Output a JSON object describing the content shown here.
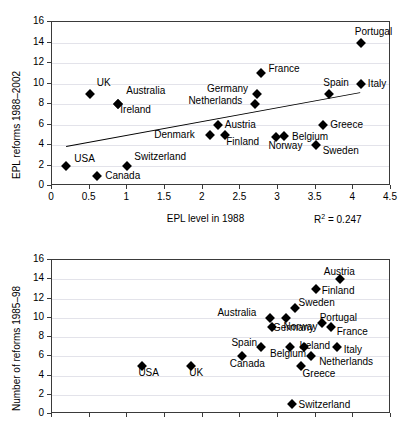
{
  "figure": {
    "background": "#ffffff",
    "marker_color": "#000000",
    "axis_color": "#3a3a3a",
    "grid_color": "#e3e3ea"
  },
  "chart_data": [
    {
      "id": "top",
      "type": "scatter",
      "title": "",
      "xlabel": "EPL level in 1988",
      "ylabel": "EPL reforms 1988–2002",
      "xlim": [
        0,
        4.5
      ],
      "ylim": [
        0,
        16
      ],
      "xticks": [
        0,
        0.5,
        1,
        1.5,
        2,
        2.5,
        3,
        3.5,
        4,
        4.5
      ],
      "xtick_labels": [
        "0",
        "0.5",
        "1",
        "1.5",
        "2",
        "2.5",
        "3",
        "3.5",
        "4",
        "4.5"
      ],
      "yticks": [
        0,
        2,
        4,
        6,
        8,
        10,
        12,
        14,
        16
      ],
      "ytick_labels": [
        "0",
        "2",
        "4",
        "6",
        "8",
        "10",
        "12",
        "14",
        "16"
      ],
      "grid": true,
      "legend": "none",
      "annotation": "R² = 0.247",
      "annotation_value": 0.247,
      "trendline": {
        "x0": 0.18,
        "y0": 3.9,
        "x1": 4.08,
        "y1": 9.15,
        "visible": true
      },
      "points": [
        {
          "label": "USA",
          "x": 0.19,
          "y": 2,
          "lx": 8,
          "ly": -12
        },
        {
          "label": "Canada",
          "x": 0.6,
          "y": 1,
          "lx": 8,
          "ly": -5
        },
        {
          "label": "UK",
          "x": 0.5,
          "y": 9,
          "lx": 7,
          "ly": -16
        },
        {
          "label": "Australia",
          "x": 0.88,
          "y": 8,
          "lx": 8,
          "ly": -18
        },
        {
          "label": "Ireland",
          "x": 0.88,
          "y": 8,
          "lx": 2,
          "ly": 1
        },
        {
          "label": "Switzerland",
          "x": 1.0,
          "y": 2,
          "lx": 7,
          "ly": -14
        },
        {
          "label": "Denmark",
          "x": 2.1,
          "y": 5,
          "lx": -56,
          "ly": -5
        },
        {
          "label": "Austria",
          "x": 2.2,
          "y": 6,
          "lx": 7,
          "ly": -5
        },
        {
          "label": "Finland",
          "x": 2.3,
          "y": 5,
          "lx": 1,
          "ly": 2
        },
        {
          "label": "Netherlands",
          "x": 2.7,
          "y": 8,
          "lx": -67,
          "ly": -8
        },
        {
          "label": "Germany",
          "x": 2.72,
          "y": 9,
          "lx": -50,
          "ly": -10
        },
        {
          "label": "France",
          "x": 2.78,
          "y": 11,
          "lx": 7,
          "ly": -9
        },
        {
          "label": "Norway",
          "x": 2.98,
          "y": 4.8,
          "lx": -8,
          "ly": 4
        },
        {
          "label": "Belgium",
          "x": 3.08,
          "y": 4.9,
          "lx": 8,
          "ly": -4
        },
        {
          "label": "Spain",
          "x": 3.68,
          "y": 9,
          "lx": -6,
          "ly": -16
        },
        {
          "label": "Greece",
          "x": 3.6,
          "y": 6,
          "lx": 7,
          "ly": -5
        },
        {
          "label": "Sweden",
          "x": 3.5,
          "y": 4,
          "lx": 7,
          "ly": 1
        },
        {
          "label": "Portugal",
          "x": 4.1,
          "y": 14,
          "lx": -6,
          "ly": -16
        },
        {
          "label": "Italy",
          "x": 4.1,
          "y": 10,
          "lx": 7,
          "ly": -5
        }
      ]
    },
    {
      "id": "bottom",
      "type": "scatter",
      "title": "",
      "xlabel": "",
      "ylabel": "Number of reforms 1985–98",
      "xlim": [
        0,
        4.5
      ],
      "ylim": [
        0,
        16
      ],
      "xticks": [
        0,
        0.5,
        1,
        1.5,
        2,
        2.5,
        3,
        3.5,
        4,
        4.5
      ],
      "xtick_labels": [
        "",
        "",
        "",
        "",
        "",
        "",
        "",
        "",
        "",
        ""
      ],
      "yticks": [
        0,
        2,
        4,
        6,
        8,
        10,
        12,
        14,
        16
      ],
      "ytick_labels": [
        "0",
        "2",
        "4",
        "6",
        "8",
        "10",
        "12",
        "14",
        "16"
      ],
      "grid": true,
      "legend": "none",
      "annotation": "",
      "trendline": {
        "visible": false
      },
      "points": [
        {
          "label": "USA",
          "x": 1.2,
          "y": 5,
          "lx": -4,
          "ly": 2
        },
        {
          "label": "UK",
          "x": 1.85,
          "y": 5,
          "lx": -2,
          "ly": 2
        },
        {
          "label": "Canada",
          "x": 2.52,
          "y": 6,
          "lx": -12,
          "ly": 3
        },
        {
          "label": "Spain",
          "x": 2.78,
          "y": 7,
          "lx": -30,
          "ly": -9
        },
        {
          "label": "Australia",
          "x": 2.9,
          "y": 10,
          "lx": -53,
          "ly": -10
        },
        {
          "label": "Germany",
          "x": 2.92,
          "y": 9,
          "lx": 1,
          "ly": -4
        },
        {
          "label": "Belgium",
          "x": 3.16,
          "y": 7,
          "lx": -20,
          "ly": 2
        },
        {
          "label": "Norway",
          "x": 3.1,
          "y": 10,
          "lx": -2,
          "ly": 4
        },
        {
          "label": "Sweden",
          "x": 3.22,
          "y": 11,
          "lx": 4,
          "ly": -10
        },
        {
          "label": "Ireland",
          "x": 3.34,
          "y": 7,
          "lx": -4,
          "ly": -6
        },
        {
          "label": "Greece",
          "x": 3.3,
          "y": 5,
          "lx": 2,
          "ly": 3
        },
        {
          "label": "Finland",
          "x": 3.5,
          "y": 13,
          "lx": 6,
          "ly": -3
        },
        {
          "label": "Portugal",
          "x": 3.58,
          "y": 9.5,
          "lx": -2,
          "ly": -10
        },
        {
          "label": "Netherlands",
          "x": 3.44,
          "y": 6,
          "lx": 8,
          "ly": 1
        },
        {
          "label": "Austria",
          "x": 3.82,
          "y": 14,
          "lx": -16,
          "ly": -12
        },
        {
          "label": "France",
          "x": 3.7,
          "y": 9,
          "lx": 6,
          "ly": 0
        },
        {
          "label": "Italy",
          "x": 3.78,
          "y": 7,
          "lx": 7,
          "ly": -2
        },
        {
          "label": "Switzerland",
          "x": 3.18,
          "y": 1,
          "lx": 7,
          "ly": -4
        }
      ]
    }
  ]
}
